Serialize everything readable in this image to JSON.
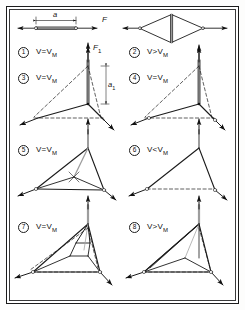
{
  "figure": {
    "type": "engineering-diagram",
    "frame_color": "#1b1b1b",
    "background_color": "#ffffff",
    "line_color": "#1b1b1b"
  },
  "top_row": {
    "left": {
      "dimension_label": "a",
      "force_label": "F",
      "name": "straight-bar-case"
    },
    "right": {
      "name": "rhombus-case"
    }
  },
  "panels": [
    {
      "id": "1",
      "marker": "1",
      "condition_prefix": "V",
      "relation": "=",
      "condition_sub": "V",
      "condition_subscript": "M",
      "condition": "V=V",
      "subscript": "M",
      "force_label": "F",
      "force_subscript": "1"
    },
    {
      "id": "2",
      "marker": "2",
      "condition": "V>V",
      "subscript": "M",
      "relation": ">"
    },
    {
      "id": "3",
      "marker": "3",
      "condition": "V=V",
      "subscript": "M",
      "relation": "=",
      "dimension_label": "a",
      "dimension_subscript": "1"
    },
    {
      "id": "4",
      "marker": "4",
      "condition": "V=V",
      "subscript": "M",
      "relation": "="
    },
    {
      "id": "5",
      "marker": "5",
      "condition": "V=V",
      "subscript": "M",
      "relation": "="
    },
    {
      "id": "6",
      "marker": "6",
      "condition": "V<V",
      "subscript": "M",
      "relation": "<"
    },
    {
      "id": "7",
      "marker": "7",
      "condition": "V=V",
      "subscript": "M",
      "relation": "="
    },
    {
      "id": "8",
      "marker": "8",
      "condition": "V>V",
      "subscript": "M",
      "relation": ">"
    }
  ],
  "labels": {
    "a": "a",
    "a1_base": "a",
    "a1_sub": "1",
    "F": "F",
    "F1_base": "F",
    "F1_sub": "1",
    "V": "V",
    "VM_sub": "M"
  }
}
